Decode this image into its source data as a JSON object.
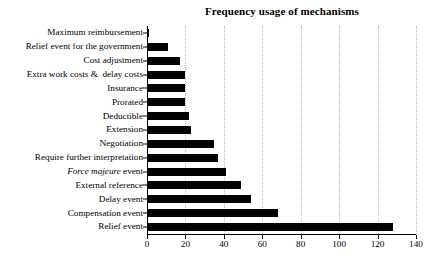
{
  "chart_data": {
    "type": "bar",
    "orientation": "horizontal",
    "title": "Frequency usage of mechanisms",
    "xlabel": "",
    "ylabel": "",
    "xlim": [
      0,
      140
    ],
    "ylim": null,
    "grid": "vertical-dotted",
    "legend": null,
    "bar_color": "#000000",
    "grid_color": "#b9b9b9",
    "axis_color": "#000000",
    "xticks": [
      0,
      20,
      40,
      60,
      80,
      100,
      120,
      140
    ],
    "categories": [
      "Maximum reimbursement",
      "Relief event for the government",
      "Cost adjustment",
      "Extra work costs &  delay costs",
      "Insurance",
      "Prorated",
      "Deductible",
      "Extension",
      "Negotiation",
      "Require further interpretation",
      "Force majeure event",
      "External reference",
      "Delay event",
      "Compensation event",
      "Relief event"
    ],
    "categories_markup": [
      "Maximum reimbursement",
      "Relief event for the government",
      "Cost adjustment",
      "Extra work costs &  delay costs",
      "Insurance",
      "Prorated",
      "Deductible",
      "Extension",
      "Negotiation",
      "Require further interpretation",
      "<span class=\"it\">Force majeure</span> event",
      "External reference",
      "Delay event",
      "Compensation event",
      "Relief event"
    ],
    "values": [
      1,
      11,
      17,
      20,
      20,
      20,
      22,
      23,
      35,
      37,
      41,
      49,
      54,
      68,
      128
    ]
  }
}
